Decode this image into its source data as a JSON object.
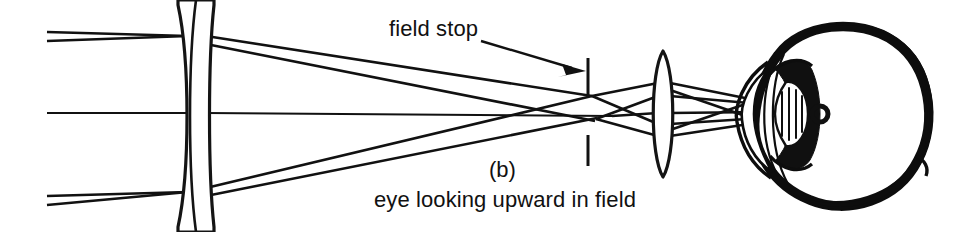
{
  "figure": {
    "domain": "diagram",
    "kind": "optical-ray-diagram",
    "part_label": "(b)",
    "caption": "eye looking upward in field",
    "annotation_label": "field stop",
    "background_color": "#ffffff",
    "ink_color": "#111111",
    "width": 957,
    "height": 232
  },
  "components": {
    "objective": {
      "name": "objective-doublet-lens",
      "center_x": 196,
      "half_height": 114
    },
    "field_stop": {
      "name": "field-stop",
      "x": 588,
      "upper_tick": {
        "y1": 58,
        "y2": 96
      },
      "lower_tick": {
        "y1": 135,
        "y2": 166
      }
    },
    "eyepiece": {
      "name": "eyepiece-lens",
      "center_x": 663,
      "half_height": 62
    },
    "eye": {
      "name": "human-eye",
      "center_x": 836,
      "center_y": 114,
      "radius": 93,
      "fovea_x": 820,
      "fovea_y": 114
    }
  },
  "ray_bundles": [
    {
      "name": "upper-field-bundle",
      "entry_y": [
        32,
        40
      ]
    },
    {
      "name": "axial-bundle",
      "entry_y": [
        113
      ]
    },
    {
      "name": "lower-field-bundle",
      "entry_y": [
        196,
        204
      ]
    }
  ],
  "annotation": {
    "leader_start_x": 481,
    "leader_start_y": 40,
    "arrow_tip_x": 586,
    "arrow_tip_y": 71
  }
}
